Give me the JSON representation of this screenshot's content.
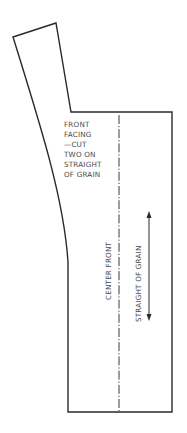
{
  "pattern_piece": {
    "name_lines": [
      "FRONT",
      "FACING",
      "—CUT",
      "TWO ON",
      "STRAIGHT",
      "OF GRAIN"
    ],
    "center_label": "CENTER FRONT",
    "grain_label": "STRAIGHT OF GRAIN",
    "colors": {
      "outline": "#2a2a2a",
      "text": "#4a4a4a",
      "background": "#ffffff"
    }
  }
}
